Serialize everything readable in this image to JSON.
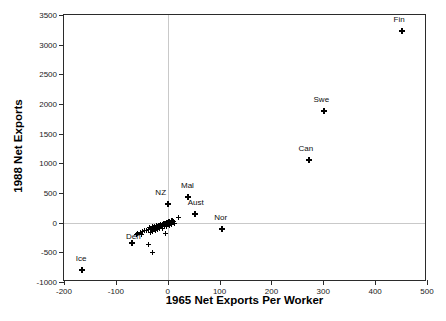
{
  "chart_data": {
    "type": "scatter",
    "title": "",
    "xlabel": "1965 Net Exports Per Worker",
    "ylabel": "1988 Net Exports",
    "xlim": [
      -200,
      500
    ],
    "ylim": [
      -1000,
      3500
    ],
    "xticks": [
      -200,
      -100,
      0,
      100,
      200,
      300,
      400,
      500
    ],
    "yticks": [
      -1000,
      -500,
      0,
      500,
      1000,
      1500,
      2000,
      2500,
      3000,
      3500
    ],
    "xtick_labels": [
      "-200",
      "-100",
      "0",
      "100",
      "200",
      "300",
      "400",
      "500"
    ],
    "ytick_labels": [
      "-1000",
      "-500",
      "0",
      "500",
      "1000",
      "1500",
      "2000",
      "2500",
      "3000",
      "3500"
    ],
    "grid": false,
    "reference_lines": {
      "x": 0,
      "y": 0
    },
    "marker": "plus",
    "marker_color": "#000000",
    "legend": null,
    "points": [
      {
        "label": "Fin",
        "x": 452,
        "y": 3230,
        "label_dx": -3,
        "label_dy": -9
      },
      {
        "label": "Swe",
        "x": 302,
        "y": 1880,
        "label_dx": -3,
        "label_dy": -9
      },
      {
        "label": "Can",
        "x": 272,
        "y": 1050,
        "label_dx": -3,
        "label_dy": -9
      },
      {
        "label": "Mal",
        "x": 40,
        "y": 440,
        "label_dx": -1,
        "label_dy": -9
      },
      {
        "label": "NZ",
        "x": 0,
        "y": 320,
        "label_dx": -7,
        "label_dy": -9
      },
      {
        "label": "Aust",
        "x": 52,
        "y": 150,
        "label_dx": 1,
        "label_dy": -9
      },
      {
        "label": "Nor",
        "x": 104,
        "y": -110,
        "label_dx": -1,
        "label_dy": -9
      },
      {
        "label": "Den",
        "x": -68,
        "y": -340,
        "label_dx": 1,
        "label_dy": -4
      },
      {
        "label": "Ice",
        "x": -165,
        "y": -790,
        "label_dx": -1,
        "label_dy": -9
      },
      {
        "label": "",
        "x": 20,
        "y": 95,
        "label_dx": 0,
        "label_dy": 0
      },
      {
        "label": "",
        "x": 10,
        "y": 40,
        "label_dx": 0,
        "label_dy": 0
      },
      {
        "label": "",
        "x": 7,
        "y": 30,
        "label_dx": 0,
        "label_dy": 0
      },
      {
        "label": "",
        "x": 4,
        "y": 18,
        "label_dx": 0,
        "label_dy": 0
      },
      {
        "label": "",
        "x": 2,
        "y": 5,
        "label_dx": 0,
        "label_dy": 0
      },
      {
        "label": "",
        "x": 0,
        "y": -5,
        "label_dx": 0,
        "label_dy": 0
      },
      {
        "label": "",
        "x": -2,
        "y": -10,
        "label_dx": 0,
        "label_dy": 0
      },
      {
        "label": "",
        "x": -4,
        "y": -15,
        "label_dx": 0,
        "label_dy": 0
      },
      {
        "label": "",
        "x": -6,
        "y": -22,
        "label_dx": 0,
        "label_dy": 0
      },
      {
        "label": "",
        "x": -8,
        "y": -28,
        "label_dx": 0,
        "label_dy": 0
      },
      {
        "label": "",
        "x": -10,
        "y": -35,
        "label_dx": 0,
        "label_dy": 0
      },
      {
        "label": "",
        "x": -12,
        "y": -42,
        "label_dx": 0,
        "label_dy": 0
      },
      {
        "label": "",
        "x": -14,
        "y": -48,
        "label_dx": 0,
        "label_dy": 0
      },
      {
        "label": "",
        "x": -16,
        "y": -55,
        "label_dx": 0,
        "label_dy": 0
      },
      {
        "label": "",
        "x": -18,
        "y": -62,
        "label_dx": 0,
        "label_dy": 0
      },
      {
        "label": "",
        "x": -20,
        "y": -68,
        "label_dx": 0,
        "label_dy": 0
      },
      {
        "label": "",
        "x": -22,
        "y": -75,
        "label_dx": 0,
        "label_dy": 0
      },
      {
        "label": "",
        "x": -25,
        "y": -80,
        "label_dx": 0,
        "label_dy": 0
      },
      {
        "label": "",
        "x": -28,
        "y": -88,
        "label_dx": 0,
        "label_dy": 0
      },
      {
        "label": "",
        "x": -31,
        "y": -95,
        "label_dx": 0,
        "label_dy": 0
      },
      {
        "label": "",
        "x": -34,
        "y": -102,
        "label_dx": 0,
        "label_dy": 0
      },
      {
        "label": "",
        "x": -37,
        "y": -112,
        "label_dx": 0,
        "label_dy": 0
      },
      {
        "label": "",
        "x": -40,
        "y": -125,
        "label_dx": 0,
        "label_dy": 0
      },
      {
        "label": "",
        "x": -44,
        "y": -138,
        "label_dx": 0,
        "label_dy": 0
      },
      {
        "label": "",
        "x": -48,
        "y": -150,
        "label_dx": 0,
        "label_dy": 0
      },
      {
        "label": "",
        "x": -53,
        "y": -165,
        "label_dx": 0,
        "label_dy": 0
      },
      {
        "label": "",
        "x": -58,
        "y": -180,
        "label_dx": 0,
        "label_dy": 0
      },
      {
        "label": "",
        "x": 1,
        "y": 15,
        "label_dx": 0,
        "label_dy": 0
      },
      {
        "label": "",
        "x": -3,
        "y": 0,
        "label_dx": 0,
        "label_dy": 0
      },
      {
        "label": "",
        "x": -5,
        "y": -8,
        "label_dx": 0,
        "label_dy": 0
      },
      {
        "label": "",
        "x": -9,
        "y": -20,
        "label_dx": 0,
        "label_dy": 0
      },
      {
        "label": "",
        "x": -13,
        "y": -30,
        "label_dx": 0,
        "label_dy": 0
      },
      {
        "label": "",
        "x": -17,
        "y": -40,
        "label_dx": 0,
        "label_dy": 0
      },
      {
        "label": "",
        "x": -21,
        "y": -52,
        "label_dx": 0,
        "label_dy": 0
      },
      {
        "label": "",
        "x": -26,
        "y": -60,
        "label_dx": 0,
        "label_dy": 0
      },
      {
        "label": "",
        "x": -30,
        "y": -70,
        "label_dx": 0,
        "label_dy": 0
      },
      {
        "label": "",
        "x": -35,
        "y": -82,
        "label_dx": 0,
        "label_dy": 0
      },
      {
        "label": "",
        "x": 6,
        "y": 10,
        "label_dx": 0,
        "label_dy": 0
      },
      {
        "label": "",
        "x": 12,
        "y": 25,
        "label_dx": 0,
        "label_dy": 0
      },
      {
        "label": "",
        "x": 14,
        "y": -20,
        "label_dx": 0,
        "label_dy": 0
      },
      {
        "label": "",
        "x": 8,
        "y": -30,
        "label_dx": 0,
        "label_dy": 0
      },
      {
        "label": "",
        "x": 3,
        "y": -45,
        "label_dx": 0,
        "label_dy": 0
      },
      {
        "label": "",
        "x": -2,
        "y": -58,
        "label_dx": 0,
        "label_dy": 0
      },
      {
        "label": "",
        "x": -7,
        "y": -70,
        "label_dx": 0,
        "label_dy": 0
      },
      {
        "label": "",
        "x": -11,
        "y": -90,
        "label_dx": 0,
        "label_dy": 0
      },
      {
        "label": "",
        "x": -15,
        "y": -105,
        "label_dx": 0,
        "label_dy": 0
      },
      {
        "label": "",
        "x": -19,
        "y": -120,
        "label_dx": 0,
        "label_dy": 0
      },
      {
        "label": "",
        "x": -24,
        "y": -135,
        "label_dx": 0,
        "label_dy": 0
      },
      {
        "label": "",
        "x": -29,
        "y": -150,
        "label_dx": 0,
        "label_dy": 0
      },
      {
        "label": "",
        "x": -33,
        "y": -168,
        "label_dx": 0,
        "label_dy": 0
      },
      {
        "label": "",
        "x": -5,
        "y": -175,
        "label_dx": 0,
        "label_dy": 0
      },
      {
        "label": "",
        "x": -38,
        "y": -375,
        "label_dx": 0,
        "label_dy": 0
      },
      {
        "label": "",
        "x": -30,
        "y": -495,
        "label_dx": 0,
        "label_dy": 0
      },
      {
        "label": "",
        "x": -50,
        "y": -195,
        "label_dx": 0,
        "label_dy": 0
      },
      {
        "label": "",
        "x": -60,
        "y": -205,
        "label_dx": 0,
        "label_dy": 0
      }
    ]
  }
}
